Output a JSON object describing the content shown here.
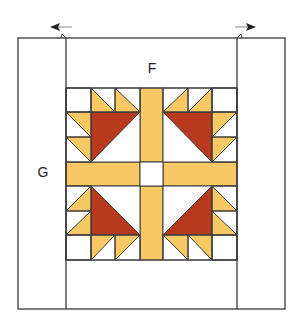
{
  "diagram": {
    "title_partial": "",
    "labels": {
      "top_border": "F",
      "side_border": "G"
    },
    "arrows": {
      "left": "arrow-left",
      "right": "arrow-right"
    },
    "colors": {
      "line": "#3a3a3a",
      "background": "#ffffff",
      "red": "#b83a1e",
      "gold": "#f7c863"
    },
    "geometry": {
      "outer": {
        "x1": 18,
        "y1": 38,
        "x2": 285,
        "y2": 309
      },
      "inner_left_x": 66,
      "inner_right_x": 237,
      "block": {
        "x1": 66,
        "y1": 88,
        "x2": 237,
        "y2": 260
      },
      "cols": [
        66,
        91,
        115,
        140,
        163,
        188,
        212,
        237
      ],
      "rows": [
        88,
        112,
        137,
        162,
        186,
        211,
        235,
        260
      ]
    }
  }
}
